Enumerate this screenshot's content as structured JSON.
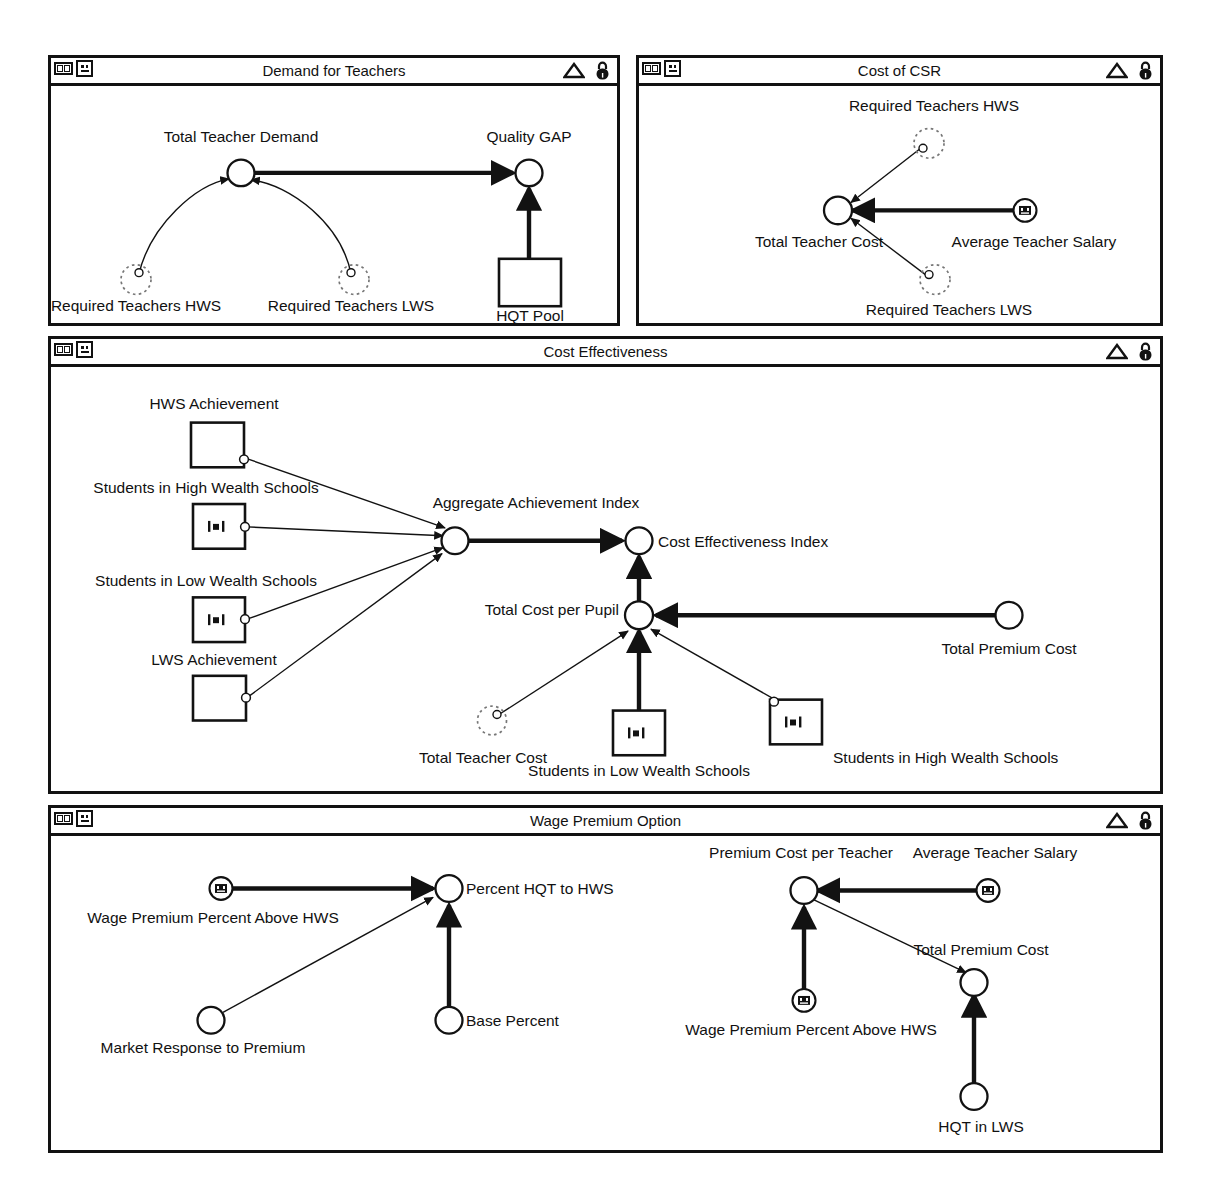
{
  "panels": [
    {
      "id": "demand-for-teachers",
      "title": "Demand for Teachers",
      "icons": {
        "panes": "panes-icon",
        "face": "face-icon",
        "triangle": "triangle-icon",
        "lock": "lock-icon"
      },
      "nodes": [
        {
          "id": "total-teacher-demand",
          "label": "Total Teacher Demand",
          "type": "auxiliary"
        },
        {
          "id": "quality-gap",
          "label": "Quality GAP",
          "type": "auxiliary"
        },
        {
          "id": "required-teachers-hws",
          "label": "Required Teachers HWS",
          "type": "ghost"
        },
        {
          "id": "required-teachers-lws",
          "label": "Required Teachers LWS",
          "type": "ghost"
        },
        {
          "id": "hqt-pool",
          "label": "HQT Pool",
          "type": "stock"
        }
      ],
      "links": [
        {
          "from": "required-teachers-hws",
          "to": "total-teacher-demand",
          "style": "thin-curve"
        },
        {
          "from": "required-teachers-lws",
          "to": "total-teacher-demand",
          "style": "thin-curve"
        },
        {
          "from": "total-teacher-demand",
          "to": "quality-gap",
          "style": "thick"
        },
        {
          "from": "hqt-pool",
          "to": "quality-gap",
          "style": "thick"
        }
      ]
    },
    {
      "id": "cost-of-csr",
      "title": "Cost of CSR",
      "icons": {
        "panes": "panes-icon",
        "face": "face-icon",
        "triangle": "triangle-icon",
        "lock": "lock-icon"
      },
      "nodes": [
        {
          "id": "required-teachers-hws",
          "label": "Required Teachers HWS",
          "type": "ghost"
        },
        {
          "id": "total-teacher-cost",
          "label": "Total Teacher Cost",
          "type": "auxiliary"
        },
        {
          "id": "average-teacher-salary",
          "label": "Average Teacher Salary",
          "type": "constant-slider"
        },
        {
          "id": "required-teachers-lws",
          "label": "Required Teachers LWS",
          "type": "ghost"
        }
      ],
      "links": [
        {
          "from": "required-teachers-hws",
          "to": "total-teacher-cost",
          "style": "thin"
        },
        {
          "from": "average-teacher-salary",
          "to": "total-teacher-cost",
          "style": "thick"
        },
        {
          "from": "required-teachers-lws",
          "to": "total-teacher-cost",
          "style": "thin"
        }
      ]
    },
    {
      "id": "cost-effectiveness",
      "title": "Cost Effectiveness",
      "icons": {
        "panes": "panes-icon",
        "face": "face-icon",
        "triangle": "triangle-icon",
        "lock": "lock-icon"
      },
      "nodes": [
        {
          "id": "hws-achievement",
          "label": "HWS Achievement",
          "type": "stock"
        },
        {
          "id": "students-hws-1",
          "label": "Students in High Wealth Schools",
          "type": "stock-chart"
        },
        {
          "id": "students-lws-1",
          "label": "Students in Low Wealth Schools",
          "type": "stock-chart"
        },
        {
          "id": "lws-achievement",
          "label": "LWS Achievement",
          "type": "stock"
        },
        {
          "id": "aggregate-achievement-index",
          "label": "Aggregate Achievement Index",
          "type": "auxiliary"
        },
        {
          "id": "cost-effectiveness-index",
          "label": "Cost Effectiveness Index",
          "type": "auxiliary"
        },
        {
          "id": "total-cost-per-pupil",
          "label": "Total Cost per Pupil",
          "type": "auxiliary"
        },
        {
          "id": "total-premium-cost",
          "label": "Total Premium Cost",
          "type": "auxiliary"
        },
        {
          "id": "total-teacher-cost",
          "label": "Total Teacher Cost",
          "type": "ghost"
        },
        {
          "id": "students-lws-2",
          "label": "Students in Low Wealth Schools",
          "type": "stock-chart"
        },
        {
          "id": "students-hws-2",
          "label": "Students in High Wealth Schools",
          "type": "stock-chart"
        }
      ],
      "links": [
        {
          "from": "hws-achievement",
          "to": "aggregate-achievement-index",
          "style": "thin"
        },
        {
          "from": "students-hws-1",
          "to": "aggregate-achievement-index",
          "style": "thin"
        },
        {
          "from": "students-lws-1",
          "to": "aggregate-achievement-index",
          "style": "thin"
        },
        {
          "from": "lws-achievement",
          "to": "aggregate-achievement-index",
          "style": "thin"
        },
        {
          "from": "aggregate-achievement-index",
          "to": "cost-effectiveness-index",
          "style": "thick"
        },
        {
          "from": "total-cost-per-pupil",
          "to": "cost-effectiveness-index",
          "style": "thick"
        },
        {
          "from": "total-premium-cost",
          "to": "total-cost-per-pupil",
          "style": "thick"
        },
        {
          "from": "total-teacher-cost",
          "to": "total-cost-per-pupil",
          "style": "thin"
        },
        {
          "from": "students-lws-2",
          "to": "total-cost-per-pupil",
          "style": "thick"
        },
        {
          "from": "students-hws-2",
          "to": "total-cost-per-pupil",
          "style": "thin"
        }
      ]
    },
    {
      "id": "wage-premium-option",
      "title": "Wage Premium Option",
      "icons": {
        "panes": "panes-icon",
        "face": "face-icon",
        "triangle": "triangle-icon",
        "lock": "lock-icon"
      },
      "nodes": [
        {
          "id": "wage-premium-percent-1",
          "label": "Wage Premium Percent Above HWS",
          "type": "constant-slider"
        },
        {
          "id": "percent-hqt-to-hws",
          "label": "Percent HQT to HWS",
          "type": "auxiliary"
        },
        {
          "id": "market-response-to-premium",
          "label": "Market Response to Premium",
          "type": "auxiliary"
        },
        {
          "id": "base-percent",
          "label": "Base Percent",
          "type": "auxiliary"
        },
        {
          "id": "premium-cost-per-teacher",
          "label": "Premium Cost per Teacher",
          "type": "auxiliary"
        },
        {
          "id": "average-teacher-salary",
          "label": "Average Teacher Salary",
          "type": "constant-slider"
        },
        {
          "id": "wage-premium-percent-2",
          "label": "Wage Premium Percent Above HWS",
          "type": "constant-slider"
        },
        {
          "id": "total-premium-cost",
          "label": "Total Premium Cost",
          "type": "auxiliary"
        },
        {
          "id": "hqt-in-lws",
          "label": "HQT in LWS",
          "type": "auxiliary"
        }
      ],
      "links": [
        {
          "from": "wage-premium-percent-1",
          "to": "percent-hqt-to-hws",
          "style": "thick"
        },
        {
          "from": "market-response-to-premium",
          "to": "percent-hqt-to-hws",
          "style": "thin"
        },
        {
          "from": "base-percent",
          "to": "percent-hqt-to-hws",
          "style": "thick"
        },
        {
          "from": "average-teacher-salary",
          "to": "premium-cost-per-teacher",
          "style": "thick"
        },
        {
          "from": "wage-premium-percent-2",
          "to": "premium-cost-per-teacher",
          "style": "thick"
        },
        {
          "from": "premium-cost-per-teacher",
          "to": "total-premium-cost",
          "style": "thin"
        },
        {
          "from": "hqt-in-lws",
          "to": "total-premium-cost",
          "style": "thick"
        }
      ]
    }
  ],
  "labels": {
    "p1": {
      "total_teacher_demand": "Total Teacher Demand",
      "quality_gap": "Quality GAP",
      "required_teachers_hws": "Required Teachers HWS",
      "required_teachers_lws": "Required Teachers LWS",
      "hqt_pool": "HQT Pool"
    },
    "p2": {
      "required_teachers_hws": "Required Teachers HWS",
      "total_teacher_cost": "Total Teacher Cost",
      "average_teacher_salary": "Average Teacher Salary",
      "required_teachers_lws": "Required Teachers LWS"
    },
    "p3": {
      "hws_achievement": "HWS Achievement",
      "students_hws_1": "Students in High Wealth Schools",
      "students_lws_1": "Students in Low Wealth Schools",
      "lws_achievement": "LWS Achievement",
      "aggregate_achievement_index": "Aggregate Achievement Index",
      "cost_effectiveness_index": "Cost Effectiveness Index",
      "total_cost_per_pupil": "Total Cost per Pupil",
      "total_premium_cost": "Total Premium Cost",
      "total_teacher_cost": "Total Teacher Cost",
      "students_lws_2": "Students in Low Wealth Schools",
      "students_hws_2": "Students in High Wealth Schools"
    },
    "p4": {
      "wage_premium_percent_1": "Wage Premium Percent Above HWS",
      "percent_hqt_to_hws": "Percent HQT to HWS",
      "market_response_to_premium": "Market Response to Premium",
      "base_percent": "Base Percent",
      "premium_cost_per_teacher": "Premium Cost per Teacher",
      "average_teacher_salary": "Average Teacher Salary",
      "wage_premium_percent_2": "Wage Premium Percent Above HWS",
      "total_premium_cost": "Total Premium Cost",
      "hqt_in_lws": "HQT in LWS"
    }
  },
  "titles": {
    "p1": "Demand for Teachers",
    "p2": "Cost of CSR",
    "p3": "Cost Effectiveness",
    "p4": "Wage Premium Option"
  },
  "colors": {
    "stroke": "#121212",
    "background": "#ffffff",
    "ghost_stroke": "#6f6f6f"
  }
}
